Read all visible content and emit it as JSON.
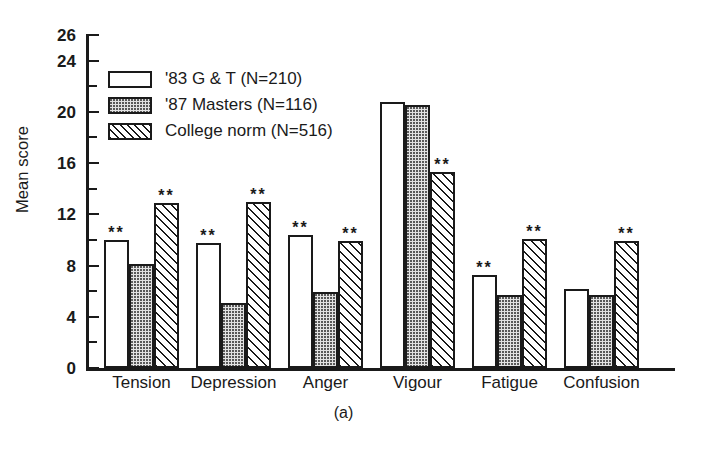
{
  "chart_data": {
    "type": "bar",
    "title": "",
    "subtitle": "",
    "caption": "(a)",
    "xlabel": "",
    "ylabel": "Mean score",
    "ylim": [
      0,
      26
    ],
    "ytick_labels": [
      "0",
      "4",
      "8",
      "12",
      "16",
      "20",
      "24",
      "26"
    ],
    "ytick_values": [
      0,
      4,
      8,
      12,
      16,
      20,
      24,
      26
    ],
    "yminor_step": 2,
    "grid": false,
    "legend_position": "upper-left-inside",
    "categories": [
      "Tension",
      "Depression",
      "Anger",
      "Vigour",
      "Fatigue",
      "Confusion"
    ],
    "series": [
      {
        "name": "'83 G & T (N=210)",
        "pattern": "open",
        "values": [
          10.0,
          9.8,
          10.4,
          20.8,
          7.3,
          6.2
        ],
        "significance": [
          "**",
          "**",
          "**",
          "",
          "**",
          ""
        ]
      },
      {
        "name": "'87 Masters (N=116)",
        "pattern": "stippled",
        "values": [
          8.1,
          5.1,
          5.9,
          20.5,
          5.7,
          5.7
        ],
        "significance": [
          "",
          "",
          "",
          "",
          "",
          ""
        ]
      },
      {
        "name": "College norm (N=516)",
        "pattern": "diagonal-hatch",
        "values": [
          12.9,
          13.0,
          9.9,
          15.3,
          10.1,
          9.9
        ],
        "significance": [
          "**",
          "**",
          "**",
          "**",
          "**",
          "**"
        ]
      }
    ],
    "significance_marker": "**",
    "colors": {
      "axis": "#1a1a1a",
      "text": "#1a1a1a",
      "background": "#ffffff",
      "open_fill": "#ffffff",
      "stippled_fill": "#e3e3e3",
      "hatch_line": "#1a1a1a"
    }
  },
  "legend": {
    "items": [
      {
        "label": "'83 G & T (N=210)",
        "pattern": "open"
      },
      {
        "label": "'87 Masters (N=116)",
        "pattern": "stippled"
      },
      {
        "label": "College norm (N=516)",
        "pattern": "diagonal-hatch"
      }
    ]
  }
}
